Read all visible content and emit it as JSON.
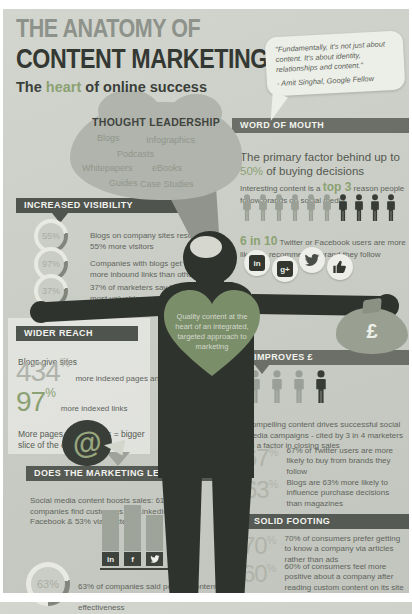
{
  "page": {
    "title_line1": "THE ANATOMY OF",
    "title_line2": "CONTENT MARKETING",
    "subtitle_pre": "The ",
    "subtitle_accent": "heart",
    "subtitle_post": " of online success"
  },
  "colors": {
    "accent_green": "#8ba173",
    "dark": "#343833",
    "band_gray": "#565a54",
    "background": "#cacdc5"
  },
  "quote": {
    "text": "\"Fundamentally, it's not just about content. It's about identity, relationships and content.\"",
    "attribution": "- Amit Singhal, Google Fellow"
  },
  "thought_leadership": {
    "title": "THOUGHT LEADERSHIP",
    "items": [
      "Blogs",
      "Infographics",
      "Podcasts",
      "Whitepapers",
      "eBooks",
      "Guides",
      "Case Studies"
    ]
  },
  "word_of_mouth": {
    "header": "WORD OF MOUTH",
    "lead_pre": "The primary factor behind up to ",
    "lead_accent": "50%",
    "lead_post": " of buying decisions",
    "sub_pre": "Interesting content is a ",
    "sub_accent": "top 3",
    "sub_post": " reason people follow brands on social media",
    "stat_accent": "6 in 10",
    "stat_post": " Twitter or Facebook users are more likely to recommend a brand they follow"
  },
  "increased_visibility": {
    "header": "INCREASED VISIBILITY",
    "items": [
      {
        "pct": "55%",
        "text": "Blogs on company sites result in 55% more visitors"
      },
      {
        "pct": "97%",
        "text": "Companies with blogs get 97% more inbound links than others"
      },
      {
        "pct": "37%",
        "text": "37% of marketers say blogs are the most valuable content type for marketing"
      }
    ]
  },
  "heart": {
    "text": "Quality content at the heart of an integrated, targeted approach to marketing"
  },
  "money_bag": {
    "symbol": "£"
  },
  "social": {
    "linkedin_label": "in",
    "gplus_label": "g+",
    "facebook_label": "f"
  },
  "wider_reach": {
    "header": "WIDER REACH",
    "intro": "Blogs give sites",
    "stat1_value": "434",
    "stat1_sup": "%",
    "stat1_text": "more indexed pages and",
    "stat2_value": "97",
    "stat2_sup": "%",
    "stat2_text": "more indexed links",
    "note": "More pages + more links = bigger slice of the online pie",
    "pie_symbol": "@"
  },
  "improves": {
    "header": "IMPROVES £",
    "para": "Compelling content drives successful social media campaigns - cited by 3 in 4 marketers as a factor in closing sales",
    "stats": [
      {
        "value": "67",
        "sup": "%",
        "text": "67% of Twitter users are more likely to buy from brands they follow"
      },
      {
        "value": "63",
        "sup": "%",
        "text": "Blogs are 63% more likely to influence purchase decisions than magazines"
      }
    ]
  },
  "legwork": {
    "header": "DOES THE MARKETING LEGWORK FOR YOU",
    "para": "Social media content boosts sales: 61% of companies find customers via LinkedIn, 67% via Facebook & 53% via Twitter",
    "bars": [
      {
        "network": "LinkedIn",
        "label": "in",
        "value": 61
      },
      {
        "network": "Facebook",
        "label": "f",
        "value": 67
      },
      {
        "network": "Twitter",
        "label": "",
        "value": 53
      }
    ],
    "stat_pct": "63%",
    "stat_text": "63% of companies said posting content on social media has increased marketing effectiveness"
  },
  "solid_footing": {
    "header": "SOLID FOOTING",
    "stats": [
      {
        "value": "70",
        "sup": "%",
        "text": "70% of consumers prefer getting to know a company via articles rather than ads"
      },
      {
        "value": "60",
        "sup": "%",
        "text": "60% of consumers feel more positive about a company after reading custom content on its site"
      }
    ]
  },
  "chart_data": [
    {
      "type": "bar",
      "title": "Companies finding customers via social media",
      "categories": [
        "LinkedIn",
        "Facebook",
        "Twitter"
      ],
      "values": [
        61,
        67,
        53
      ],
      "xlabel": "Social network",
      "ylabel": "% of companies",
      "ylim": [
        0,
        100
      ],
      "legend": "none"
    },
    {
      "type": "table",
      "title": "Key content marketing statistics",
      "columns": [
        "Statistic",
        "Value"
      ],
      "rows": [
        [
          "More visitors from blogs on company sites",
          "55%"
        ],
        [
          "More inbound links for companies with blogs",
          "97%"
        ],
        [
          "Marketers saying blogs are the most valuable content type",
          "37%"
        ],
        [
          "More indexed pages from blogs",
          "434%"
        ],
        [
          "More indexed links from blogs",
          "97%"
        ],
        [
          "Buying decisions driven by word of mouth",
          "50%"
        ],
        [
          "Twitter/Facebook users more likely to recommend a followed brand",
          "6 in 10"
        ],
        [
          "Marketers citing social campaigns as a factor in closing sales",
          "3 in 4"
        ],
        [
          "Twitter users more likely to buy from brands they follow",
          "67%"
        ],
        [
          "Blogs more likely than magazines to influence purchases",
          "63%"
        ],
        [
          "Consumers preferring articles over ads",
          "70%"
        ],
        [
          "Consumers more positive after reading custom content",
          "60%"
        ],
        [
          "Companies reporting increased marketing effectiveness from social posting",
          "63%"
        ]
      ]
    }
  ]
}
